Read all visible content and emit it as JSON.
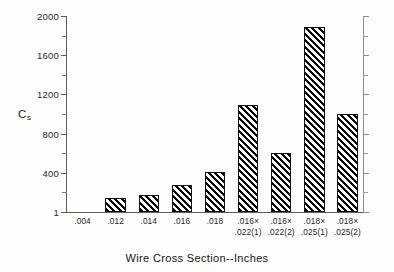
{
  "chart_data": {
    "type": "bar",
    "title": "",
    "subtitle": "",
    "xlabel": "Wire Cross Section--Inches",
    "ylabel": "Cs",
    "ylabel_base": "C",
    "ylabel_sub": "s",
    "categories": [
      ".004",
      ".012",
      ".014",
      ".016",
      ".018",
      ".016×\n.022(1)",
      ".016×\n.022(2)",
      ".018×\n.025(1)",
      ".018×\n.025(2)"
    ],
    "category_lines": [
      [
        ".004"
      ],
      [
        ".012"
      ],
      [
        ".014"
      ],
      [
        ".016"
      ],
      [
        ".018"
      ],
      [
        ".016×",
        ".022(1)"
      ],
      [
        ".016×",
        ".022(2)"
      ],
      [
        ".018×",
        ".025(1)"
      ],
      [
        ".018×",
        ".025(2)"
      ]
    ],
    "values": [
      0,
      140,
      175,
      275,
      410,
      1095,
      600,
      1890,
      1000
    ],
    "ylim": [
      1,
      2000
    ],
    "xlim_note": "categorical",
    "ytick_values": [
      1,
      200,
      400,
      600,
      800,
      1000,
      1200,
      1400,
      1600,
      1800,
      2000
    ],
    "ytick_labels_major": [
      "1",
      "400",
      "800",
      "1200",
      "1600",
      "2000"
    ],
    "ytick_major_values": [
      1,
      400,
      800,
      1200,
      1600,
      2000
    ],
    "ytick_minor_values": [
      200,
      600,
      1000,
      1400,
      1800
    ],
    "grid": false,
    "legend": null,
    "legend_position": "none",
    "bar_fill": "diagonal-hatch-black",
    "bar_edge_color": "#111111",
    "background_color": "#fdfdfb",
    "axis_color": "#5d5d5d",
    "annotations": []
  },
  "figure": {
    "x_axis_title": "Wire Cross Section--Inches",
    "y_axis_title_base": "C",
    "y_axis_title_sub": "s"
  }
}
